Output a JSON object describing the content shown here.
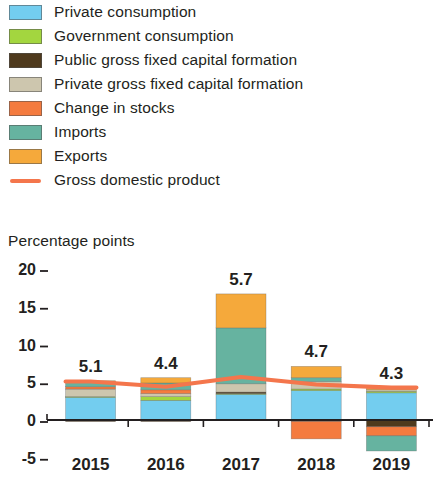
{
  "axis_title": "Percentage points",
  "legend": {
    "items": [
      {
        "label": "Private consumption",
        "color": "#73cdef",
        "type": "swatch"
      },
      {
        "label": "Government consumption",
        "color": "#9ed martial",
        "type": "swatch"
      },
      {
        "label": "Public gross fixed capital formation",
        "color": "#4f3a1d",
        "type": "swatch"
      },
      {
        "label": "Private gross fixed capital formation",
        "color": "#cdc6ae",
        "type": "swatch"
      },
      {
        "label": "Change in stocks",
        "color": "#f47b3f",
        "type": "swatch"
      },
      {
        "label": "Imports",
        "color": "#66b3a0",
        "type": "swatch"
      },
      {
        "label": "Exports",
        "color": "#f5a93b",
        "type": "swatch"
      },
      {
        "label": "Gross domestic product",
        "color": "#f4764c",
        "type": "line"
      }
    ]
  },
  "chart_data": {
    "type": "bar",
    "subtype": "stacked-bar-with-line",
    "title": "",
    "xlabel": "",
    "ylabel": "Percentage points",
    "ylim": [
      -6,
      21
    ],
    "yticks": [
      20,
      15,
      10,
      5,
      0,
      -5
    ],
    "ytick_labels": [
      "20",
      "15",
      "10",
      "5",
      "0",
      "-5"
    ],
    "grid": false,
    "legend_position": "top",
    "categories": [
      "2015",
      "2016",
      "2017",
      "2018",
      "2019"
    ],
    "series": [
      {
        "name": "Private consumption",
        "color": "#73cdef",
        "values": [
          3.0,
          2.6,
          3.4,
          3.9,
          3.6
        ]
      },
      {
        "name": "Government consumption",
        "color": "#a3d63f",
        "values": [
          0.1,
          0.5,
          0.1,
          0.2,
          0.2
        ]
      },
      {
        "name": "Public gross fixed capital formation",
        "color": "#4f3a1d",
        "values": [
          -0.2,
          -0.2,
          0.2,
          -0.2,
          -0.9
        ]
      },
      {
        "name": "Private gross fixed capital formation",
        "color": "#cdc6ae",
        "values": [
          1.0,
          0.4,
          1.1,
          1.0,
          0.2
        ]
      },
      {
        "name": "Change in stocks",
        "color": "#f47b3f",
        "values": [
          0.3,
          0.5,
          0.0,
          -2.3,
          -1.2
        ]
      },
      {
        "name": "Imports",
        "color": "#66b3a0",
        "values": [
          0.7,
          0.9,
          7.4,
          0.5,
          -2.0
        ]
      },
      {
        "name": "Exports",
        "color": "#f5a93b",
        "values": [
          0.1,
          0.7,
          4.5,
          1.5,
          0.3
        ]
      }
    ],
    "line_series": {
      "name": "Gross domestic product",
      "color": "#f4764c",
      "values": [
        5.1,
        4.4,
        5.7,
        4.7,
        4.3
      ],
      "labels": [
        "5.1",
        "4.4",
        "5.7",
        "4.7",
        "4.3"
      ]
    },
    "bar_value_labels": [
      "5.1",
      "4.4",
      "5.7",
      "4.7",
      "4.3"
    ]
  }
}
